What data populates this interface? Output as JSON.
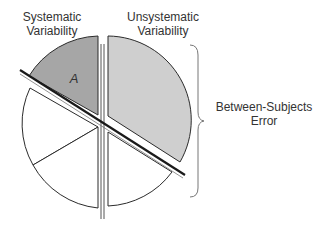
{
  "labels": {
    "systematic": [
      "Systematic",
      "Variability"
    ],
    "unsystematic": [
      "Unsystematic",
      "Variability"
    ],
    "between": [
      "Between-Subjects",
      "Error"
    ],
    "segment_a": "A"
  },
  "colors": {
    "segment_a": "#a6a6a6",
    "unsystematic_fill": "#cfcfcf",
    "white_segments": "#ffffff",
    "stroke": "#2b2b2b"
  }
}
